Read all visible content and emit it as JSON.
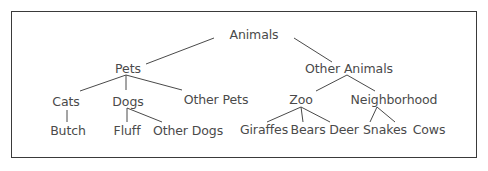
{
  "diagram": {
    "type": "tree",
    "colors": {
      "text": "#4a4a4a",
      "line": "#4a4a4a",
      "frame": "#3a3a3a",
      "background": "#ffffff"
    },
    "nodes": [
      {
        "id": "animals",
        "label": "Animals",
        "x": 254,
        "y": 35
      },
      {
        "id": "pets",
        "label": "Pets",
        "x": 128,
        "y": 69
      },
      {
        "id": "other_animals",
        "label": "Other Animals",
        "x": 349,
        "y": 69
      },
      {
        "id": "cats",
        "label": "Cats",
        "x": 66,
        "y": 102
      },
      {
        "id": "dogs",
        "label": "Dogs",
        "x": 128,
        "y": 102
      },
      {
        "id": "other_pets",
        "label": "Other Pets",
        "x": 216,
        "y": 100
      },
      {
        "id": "zoo",
        "label": "Zoo",
        "x": 301,
        "y": 100
      },
      {
        "id": "neighborhood",
        "label": "Neighborhood",
        "x": 394,
        "y": 100
      },
      {
        "id": "butch",
        "label": "Butch",
        "x": 68,
        "y": 131
      },
      {
        "id": "fluff",
        "label": "Fluff",
        "x": 127,
        "y": 131
      },
      {
        "id": "other_dogs",
        "label": "Other Dogs",
        "x": 188,
        "y": 131
      },
      {
        "id": "giraffes",
        "label": "Giraffes",
        "x": 264,
        "y": 130
      },
      {
        "id": "bears",
        "label": "Bears",
        "x": 308,
        "y": 130
      },
      {
        "id": "deer",
        "label": "Deer",
        "x": 344,
        "y": 130
      },
      {
        "id": "snakes",
        "label": "Snakes",
        "x": 385,
        "y": 130
      },
      {
        "id": "cows",
        "label": "Cows",
        "x": 429,
        "y": 130
      }
    ],
    "edges": [
      {
        "from": "animals",
        "to": "pets",
        "x1": 214,
        "y1": 38,
        "x2": 146,
        "y2": 64
      },
      {
        "from": "animals",
        "to": "other_animals",
        "x1": 294,
        "y1": 38,
        "x2": 332,
        "y2": 62
      },
      {
        "from": "pets",
        "to": "cats",
        "x1": 126,
        "y1": 75,
        "x2": 80,
        "y2": 91
      },
      {
        "from": "pets",
        "to": "dogs",
        "x1": 126,
        "y1": 75,
        "x2": 126,
        "y2": 90
      },
      {
        "from": "pets",
        "to": "other_pets",
        "x1": 126,
        "y1": 75,
        "x2": 182,
        "y2": 90
      },
      {
        "from": "other_animals",
        "to": "zoo",
        "x1": 347,
        "y1": 75,
        "x2": 316,
        "y2": 91
      },
      {
        "from": "other_animals",
        "to": "neighborhood",
        "x1": 347,
        "y1": 75,
        "x2": 375,
        "y2": 91
      },
      {
        "from": "cats",
        "to": "butch",
        "x1": 67,
        "y1": 110,
        "x2": 67,
        "y2": 122
      },
      {
        "from": "dogs",
        "to": "fluff",
        "x1": 127,
        "y1": 108,
        "x2": 127,
        "y2": 122
      },
      {
        "from": "dogs",
        "to": "other_dogs",
        "x1": 127,
        "y1": 108,
        "x2": 162,
        "y2": 122
      },
      {
        "from": "zoo",
        "to": "giraffes",
        "x1": 301,
        "y1": 107,
        "x2": 267,
        "y2": 122
      },
      {
        "from": "zoo",
        "to": "bears",
        "x1": 301,
        "y1": 107,
        "x2": 303,
        "y2": 122
      },
      {
        "from": "zoo",
        "to": "deer",
        "x1": 301,
        "y1": 107,
        "x2": 330,
        "y2": 122
      },
      {
        "from": "neighborhood",
        "to": "snakes",
        "x1": 377,
        "y1": 107,
        "x2": 370,
        "y2": 122
      },
      {
        "from": "neighborhood",
        "to": "cows",
        "x1": 377,
        "y1": 107,
        "x2": 395,
        "y2": 122
      }
    ]
  }
}
